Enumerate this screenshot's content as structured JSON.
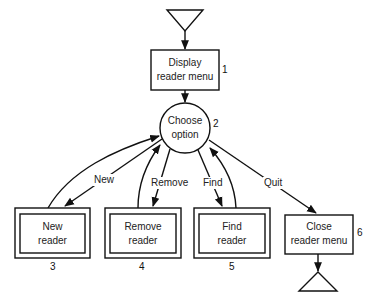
{
  "diagram": {
    "type": "flowchart",
    "nodes": [
      {
        "id": "start",
        "shape": "triangle-down"
      },
      {
        "id": "display",
        "shape": "rect",
        "label_line1": "Display",
        "label_line2": "reader menu",
        "number": "1"
      },
      {
        "id": "choose",
        "shape": "circle",
        "label_line1": "Choose",
        "label_line2": "option",
        "number": "2"
      },
      {
        "id": "new",
        "shape": "double-rect",
        "label_line1": "New",
        "label_line2": "reader",
        "number": "3"
      },
      {
        "id": "remove",
        "shape": "double-rect",
        "label_line1": "Remove",
        "label_line2": "reader",
        "number": "4"
      },
      {
        "id": "find",
        "shape": "double-rect",
        "label_line1": "Find",
        "label_line2": "reader",
        "number": "5"
      },
      {
        "id": "close",
        "shape": "rect",
        "label_line1": "Close",
        "label_line2": "reader menu",
        "number": "6"
      },
      {
        "id": "end",
        "shape": "triangle-down"
      }
    ],
    "edges": [
      {
        "from": "start",
        "to": "display",
        "label": ""
      },
      {
        "from": "display",
        "to": "choose",
        "label": ""
      },
      {
        "from": "choose",
        "to": "new",
        "label": "New"
      },
      {
        "from": "new",
        "to": "choose",
        "label": ""
      },
      {
        "from": "choose",
        "to": "remove",
        "label": "Remove"
      },
      {
        "from": "remove",
        "to": "choose",
        "label": ""
      },
      {
        "from": "choose",
        "to": "find",
        "label": "Find"
      },
      {
        "from": "find",
        "to": "choose",
        "label": ""
      },
      {
        "from": "choose",
        "to": "close",
        "label": "Quit"
      },
      {
        "from": "close",
        "to": "end",
        "label": ""
      }
    ]
  }
}
